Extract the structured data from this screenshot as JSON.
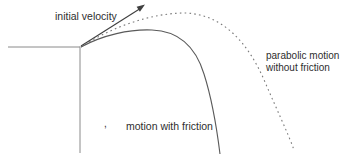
{
  "diagram": {
    "labels": {
      "initial_velocity": "initial velocity",
      "no_friction_line1": "parabolic motion",
      "no_friction_line2": "without friction",
      "with_friction": "motion with friction",
      "stray_mark": ","
    },
    "curves": [
      {
        "name": "parabolic motion without friction",
        "style": "dotted"
      },
      {
        "name": "motion with friction",
        "style": "solid"
      }
    ],
    "colors": {
      "background": "#ffffff",
      "text": "#2e2e2e",
      "axis_line": "#8a8a8a",
      "solid_curve": "#5a5a5a",
      "dotted_curve": "#7a7a7a",
      "arrow": "#3f3f3f"
    }
  }
}
